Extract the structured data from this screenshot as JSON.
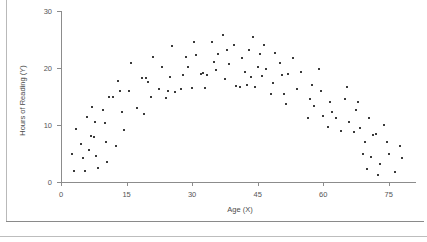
{
  "figure": {
    "clipped_title": "......",
    "background_color": "#ffffff",
    "point_color": "#3a3a3a",
    "axis_color": "#8c8c8c"
  },
  "chart_data": {
    "type": "scatter",
    "title": "",
    "xlabel": "Age (X)",
    "ylabel": "Hours of Reading (Y)",
    "xlim": [
      0,
      81
    ],
    "ylim": [
      0,
      30
    ],
    "xticks": [
      0,
      15,
      30,
      45,
      60,
      75
    ],
    "yticks": [
      0,
      10,
      20,
      30
    ],
    "xtick_labels": [
      "0",
      "15",
      "30",
      "45",
      "60",
      "75"
    ],
    "ytick_labels": [
      "0",
      "10",
      "20",
      "30"
    ],
    "grid": false,
    "legend": null,
    "marker": "square",
    "marker_size": 2,
    "series": [
      {
        "name": "Hours of Reading vs Age",
        "points": [
          [
            2.5,
            5.0
          ],
          [
            3.0,
            2.0
          ],
          [
            3.5,
            9.3
          ],
          [
            4.5,
            6.6
          ],
          [
            5.0,
            4.2
          ],
          [
            5.5,
            2.0
          ],
          [
            6.0,
            11.4
          ],
          [
            6.5,
            5.6
          ],
          [
            7.0,
            13.2
          ],
          [
            7.5,
            7.9
          ],
          [
            7.8,
            10.6
          ],
          [
            8.0,
            4.6
          ],
          [
            8.5,
            2.5
          ],
          [
            9.5,
            12.7
          ],
          [
            10.0,
            10.3
          ],
          [
            10.2,
            7.1
          ],
          [
            10.5,
            3.5
          ],
          [
            11.0,
            15.0
          ],
          [
            12.0,
            15.0
          ],
          [
            12.5,
            6.3
          ],
          [
            13.0,
            17.8
          ],
          [
            14.0,
            12.2
          ],
          [
            14.5,
            9.1
          ],
          [
            15.5,
            16.0
          ],
          [
            16.0,
            20.9
          ],
          [
            17.5,
            12.9
          ],
          [
            18.5,
            18.3
          ],
          [
            19.0,
            12.0
          ],
          [
            20.0,
            17.5
          ],
          [
            20.5,
            15.0
          ],
          [
            21.0,
            22.0
          ],
          [
            22.5,
            16.3
          ],
          [
            23.0,
            20.1
          ],
          [
            24.0,
            14.8
          ],
          [
            25.0,
            18.4
          ],
          [
            25.5,
            23.8
          ],
          [
            26.0,
            15.8
          ],
          [
            27.5,
            16.4
          ],
          [
            28.0,
            18.7
          ],
          [
            28.5,
            22.0
          ],
          [
            29.0,
            20.2
          ],
          [
            30.0,
            16.5
          ],
          [
            30.5,
            24.5
          ],
          [
            31.0,
            22.3
          ],
          [
            32.0,
            18.9
          ],
          [
            32.5,
            19.1
          ],
          [
            33.0,
            16.5
          ],
          [
            34.5,
            24.6
          ],
          [
            35.0,
            21.0
          ],
          [
            35.5,
            19.6
          ],
          [
            36.0,
            22.5
          ],
          [
            37.0,
            25.8
          ],
          [
            37.5,
            18.0
          ],
          [
            38.0,
            23.1
          ],
          [
            38.5,
            20.7
          ],
          [
            39.5,
            24.0
          ],
          [
            40.0,
            16.9
          ],
          [
            41.0,
            16.6
          ],
          [
            41.5,
            21.7
          ],
          [
            42.0,
            19.3
          ],
          [
            43.0,
            23.1
          ],
          [
            43.5,
            18.5
          ],
          [
            44.0,
            25.4
          ],
          [
            44.5,
            16.6
          ],
          [
            45.0,
            20.1
          ],
          [
            45.5,
            22.4
          ],
          [
            46.0,
            18.6
          ],
          [
            46.5,
            24.0
          ],
          [
            47.0,
            19.8
          ],
          [
            48.0,
            15.4
          ],
          [
            48.5,
            17.4
          ],
          [
            49.0,
            22.6
          ],
          [
            50.0,
            20.8
          ],
          [
            50.5,
            18.8
          ],
          [
            51.0,
            15.5
          ],
          [
            51.5,
            13.7
          ],
          [
            53.0,
            21.7
          ],
          [
            54.0,
            16.4
          ],
          [
            55.0,
            19.3
          ],
          [
            56.5,
            11.3
          ],
          [
            57.0,
            14.6
          ],
          [
            57.5,
            17.0
          ],
          [
            58.0,
            13.3
          ],
          [
            59.0,
            19.8
          ],
          [
            59.5,
            15.9
          ],
          [
            60.0,
            11.5
          ],
          [
            61.0,
            9.7
          ],
          [
            61.5,
            14.0
          ],
          [
            62.0,
            12.2
          ],
          [
            63.0,
            11.2
          ],
          [
            64.0,
            8.9
          ],
          [
            65.0,
            14.5
          ],
          [
            65.5,
            16.7
          ],
          [
            66.0,
            10.5
          ],
          [
            67.0,
            8.7
          ],
          [
            67.5,
            12.6
          ],
          [
            68.0,
            14.1
          ],
          [
            68.5,
            9.5
          ],
          [
            69.0,
            5.0
          ],
          [
            69.5,
            7.0
          ],
          [
            70.0,
            2.3
          ],
          [
            70.5,
            11.2
          ],
          [
            71.0,
            4.3
          ],
          [
            71.5,
            8.2
          ],
          [
            72.0,
            8.4
          ],
          [
            72.5,
            1.3
          ],
          [
            73.0,
            3.1
          ],
          [
            74.0,
            10.0
          ],
          [
            74.5,
            7.0
          ],
          [
            75.0,
            5.0
          ],
          [
            76.5,
            1.8
          ],
          [
            77.5,
            6.3
          ],
          [
            78.0,
            4.2
          ],
          [
            6.9,
            8.0
          ],
          [
            13.5,
            16.0
          ],
          [
            19.5,
            18.3
          ],
          [
            24.5,
            16.0
          ],
          [
            33.5,
            18.7
          ],
          [
            42.5,
            17.0
          ],
          [
            52.0,
            18.9
          ]
        ]
      }
    ]
  }
}
